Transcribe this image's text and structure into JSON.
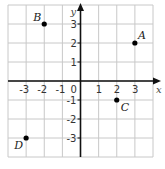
{
  "chart_data": {
    "type": "scatter",
    "title": "",
    "xlabel": "x",
    "ylabel": "y",
    "xlim": [
      -4,
      4
    ],
    "ylim": [
      -4,
      4
    ],
    "grid": true,
    "x_ticks": [
      "-3",
      "-2",
      "-1",
      "1",
      "2",
      "3"
    ],
    "y_ticks": [
      "3",
      "2",
      "1",
      "-1",
      "-2",
      "-3"
    ],
    "origin_label": "0",
    "points": [
      {
        "label": "A",
        "x": 3,
        "y": 2
      },
      {
        "label": "B",
        "x": -2,
        "y": 3
      },
      {
        "label": "C",
        "x": 2,
        "y": -1
      },
      {
        "label": "D",
        "x": -3,
        "y": -3
      }
    ]
  },
  "colors": {
    "grid": "#c8c8c8",
    "axis": "#111111",
    "point": "#000000"
  }
}
